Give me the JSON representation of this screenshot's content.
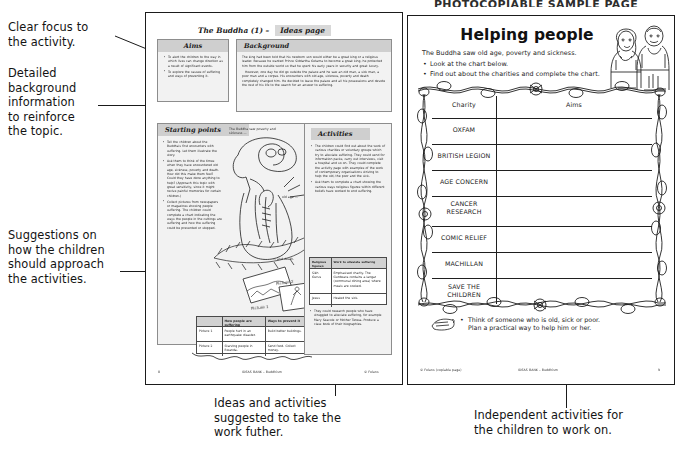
{
  "header": {
    "banner": "PHOTOCOPIABLE SAMPLE PAGE"
  },
  "annotations": [
    {
      "id": "clear-focus",
      "text": "Clear focus to\nthe activity."
    },
    {
      "id": "detailed-background",
      "text": "Detailed\nbackground\ninformation\nto reinforce\nthe topic."
    },
    {
      "id": "suggestions",
      "text": "Suggestions on\nhow the children\nshould approach\nthe activities."
    },
    {
      "id": "ideas-activities",
      "text": "Ideas and activities\nsuggested to take the\nwork futher."
    },
    {
      "id": "independent-activities",
      "text": "Independent activities for\nthe children to work on."
    }
  ],
  "left_page": {
    "title_main": "The Buddha (1) –",
    "title_tag": "Ideas page",
    "aims": {
      "heading": "Aims",
      "bullets": [
        "To alert the children to the way in which lives can change direction as a result of significant events.",
        "To explore the causes of suffering and ways of preventing it."
      ]
    },
    "background": {
      "heading": "Background",
      "paragraphs": [
        "The king had been told that his newborn son would either be a great king or a religious leader. Because he wanted Prince Siddartha Gotama to become a great king, he protected him from the outside world so that he spent his early years in security and great luxury.",
        "However, one day he did go outside the palace and he saw an old man, a sick man, a poor man and a corpse. His encounters with old age, sickness, poverty and death completely changed him. He decided to leave the palace and all his possessions and devote the rest of his life to the search for an answer to suffering."
      ]
    },
    "starting_points": {
      "heading": "Starting points",
      "bullets": [
        "Tell the children about the Buddha's first encounters with suffering. Let them illustrate the story.",
        "Ask them to think of the times when they have encountered old age, sickness, poverty and death. How did this make them feel? Could they have done anything to help? (Approach this topic with great sensitivity, since it might revive painful memories for certain children.)",
        "Collect pictures from newspapers or magazines showing people suffering. The children could complete a chart indicating the ways the people in the cuttings are suffering and how the suffering could be prevented or stopped."
      ],
      "caption_top": "The Buddha saw poverty and sickness ...",
      "caption_right": "old age ...",
      "caption_bottom": "... and death.",
      "picture_labels": [
        "Picture 1",
        "Picture 2"
      ],
      "table": {
        "headers": [
          "",
          "How people are suffering",
          "Ways to prevent it"
        ],
        "rows": [
          [
            "Picture 1",
            "People hurt in an earthquake disaster.",
            "Build better buildings."
          ],
          [
            "Picture 2",
            "Starving people in Rwanda.",
            "Send food. Collect money."
          ]
        ]
      }
    },
    "activities": {
      "heading": "Activities",
      "bullets": [
        "The children could find out about the work of various charities or voluntary groups which try to alleviate suffering. They could send for information packs, carry out interviews, visit a hospital and so on. They could complete the activity page with examples of the work of contemporary organisations striving to help the old, the poor and the sick.",
        "Ask them to complete a chart showing the various ways religious figures within different beliefs have worked to end suffering.",
        "They could research people who have struggled to alleviate suffering, for example Mary Seacole or Mother Teresa. Produce a class book of their biographies."
      ],
      "table": {
        "headers": [
          "Religious figure/s",
          "Work to alleviate suffering"
        ],
        "rows": [
          [
            "Sikh Gurus",
            "Emphasised charity. The Gurdwara contains a langar (communal dining area) where meals are cooked."
          ],
          [
            "Jesus",
            "Healed the sick."
          ]
        ]
      }
    },
    "footer_left": "8",
    "footer_center": "IDEAS BANK – Buddhism",
    "footer_right": "© Folens"
  },
  "right_page": {
    "title": "Helping people",
    "subtitle": "The Buddha saw old age, poverty and sickness.",
    "instructions": [
      "Look at the chart below.",
      "Find out about the charities and complete the chart."
    ],
    "chart": {
      "headers": [
        "Charity",
        "Aims"
      ],
      "charities": [
        "OXFAM",
        "BRITISH LEGION",
        "AGE CONCERN",
        "CANCER\nRESEARCH",
        "COMIC RELIEF",
        "MACHILLAN",
        "SAVE THE\nCHILDREN"
      ],
      "aims_values": [
        "",
        "",
        "",
        "",
        "",
        "",
        ""
      ]
    },
    "task": "Think of someone who is old, sick or poor.\nPlan a practical way to help him or her.",
    "footer_left": "© Folens (copiable page)",
    "footer_center": "IDEAS BANK – Buddhism",
    "footer_right": "9"
  },
  "colors": {
    "ink": "#1b1b1b",
    "box_fill": "#f2f2f2",
    "box_header": "#cfcfcf",
    "paper": "#ffffff"
  }
}
